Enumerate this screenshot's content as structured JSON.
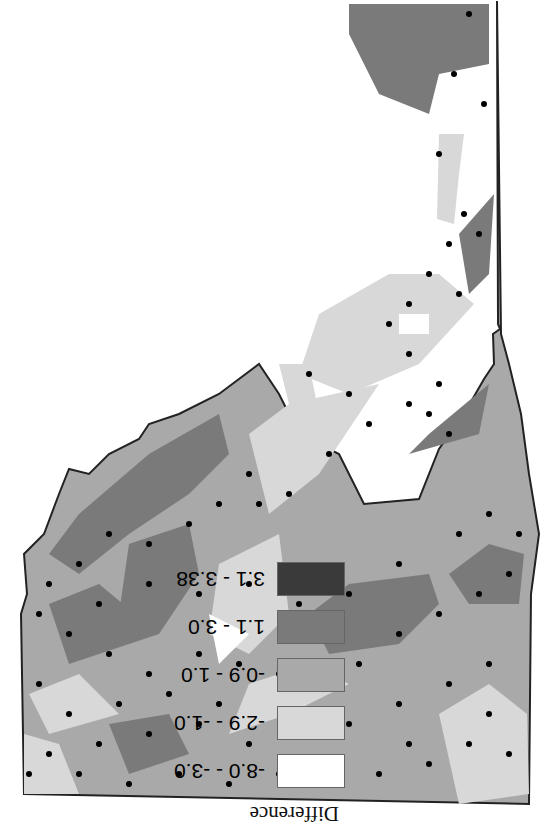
{
  "figure": {
    "orientation": "rotated 180 degrees",
    "map_type": "choropleth with station points"
  },
  "legend": {
    "title": "Difference",
    "classes": [
      {
        "label": "-8.0 - -3.0",
        "color": "#ffffff"
      },
      {
        "label": "-2.9 - -1.0",
        "color": "#d8d8d8"
      },
      {
        "label": "-0.9 - 1.0",
        "color": "#a9a9a9"
      },
      {
        "label": "1.1 - 3.0",
        "color": "#7a7a7a"
      },
      {
        "label": "3.1 - 3.38",
        "color": "#3a3a3a"
      }
    ]
  },
  "colors": {
    "outline": "#222222",
    "station": "#000000",
    "background": "#ffffff"
  }
}
